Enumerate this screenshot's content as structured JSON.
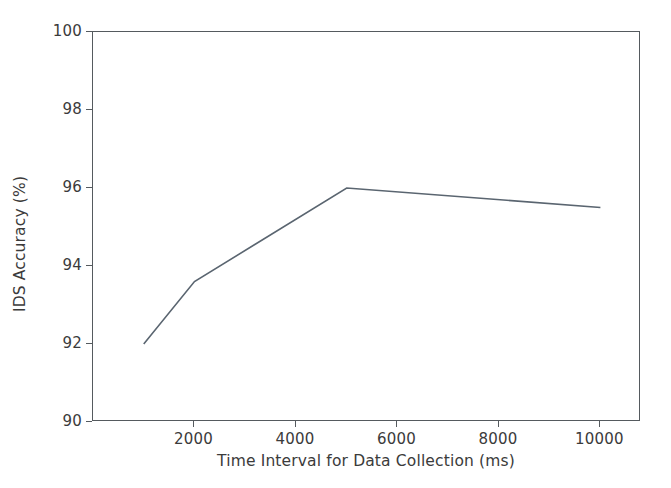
{
  "chart_data": {
    "type": "line",
    "title": "",
    "xlabel": "Time Interval for Data Collection (ms)",
    "ylabel": "IDS Accuracy (%)",
    "xlim": [
      0,
      10800
    ],
    "ylim": [
      90,
      100
    ],
    "xticks": [
      2000,
      4000,
      6000,
      8000,
      10000
    ],
    "xtick_labels": [
      "2000",
      "4000",
      "6000",
      "8000",
      "10000"
    ],
    "yticks": [
      90,
      92,
      94,
      96,
      98,
      100
    ],
    "ytick_labels": [
      "90",
      "92",
      "94",
      "96",
      "98",
      "100"
    ],
    "grid": false,
    "legend": null,
    "series": [
      {
        "name": "IDS Accuracy",
        "color": "#5a6570",
        "linewidth": 1.6,
        "marker": "none",
        "x": [
          1000,
          2000,
          5000,
          10000
        ],
        "values": [
          92.0,
          93.6,
          96.0,
          95.5
        ],
        "points": [
          {
            "x": 1000,
            "y": 92.0
          },
          {
            "x": 2000,
            "y": 93.6
          },
          {
            "x": 5000,
            "y": 96.0
          },
          {
            "x": 10000,
            "y": 95.5
          }
        ]
      }
    ]
  },
  "style": {
    "background": "#ffffff",
    "axis_color": "#555a5e",
    "text_color": "#3b3b3b",
    "line_color": "#5a6570"
  }
}
